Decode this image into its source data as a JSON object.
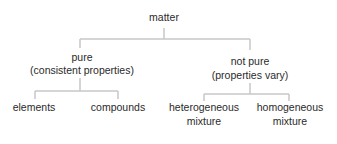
{
  "diagram": {
    "type": "tree",
    "line_color": "#c8c8c8",
    "root": {
      "label": "matter"
    },
    "level1": [
      {
        "label": "pure",
        "sub": "(consistent properties)"
      },
      {
        "label": "not pure",
        "sub": "(properties vary)"
      }
    ],
    "level2_pure": [
      {
        "label": "elements"
      },
      {
        "label": "compounds"
      }
    ],
    "level2_not_pure": [
      {
        "label": "heterogeneous",
        "sub": "mixture"
      },
      {
        "label": "homogeneous",
        "sub": "mixture"
      }
    ]
  }
}
